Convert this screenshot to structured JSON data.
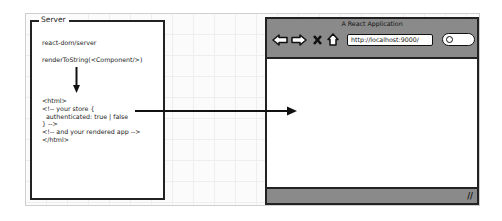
{
  "server": {
    "label": "Server",
    "module": "react-dom/server",
    "call": "renderToString(<Component/>)",
    "html_lines": [
      "<html>",
      "<!-- your store {",
      "  authenticated: true | false",
      "} -->",
      "<!-- and your rendered app -->",
      "</html>"
    ]
  },
  "browser": {
    "title": "A React Application",
    "url": "http://localhost:9000/",
    "toolbar_icons": [
      "back-arrow-icon",
      "forward-arrow-icon",
      "stop-icon",
      "home-icon"
    ],
    "search_icon": "search-icon",
    "status_grip": "resize-grip-icon",
    "grip_glyph": "//"
  },
  "connections": [
    {
      "from": "server-html-output",
      "to": "browser-content",
      "type": "arrow"
    }
  ]
}
